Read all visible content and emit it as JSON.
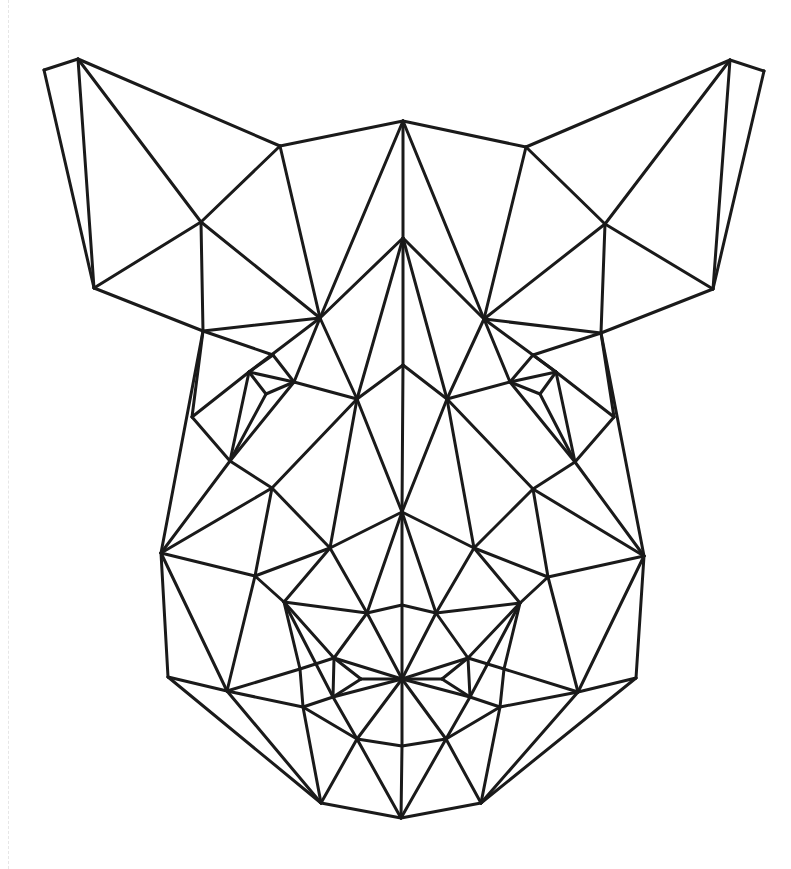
{
  "artwork": {
    "subject": "geometric low-poly boar head line drawing",
    "stroke_color": "#1a1a1a",
    "background_color": "#ffffff",
    "vertices": {
      "lE1": [
        44,
        70
      ],
      "lE2": [
        78,
        59
      ],
      "lE3": [
        280,
        146
      ],
      "lE4": [
        201,
        222
      ],
      "lE5": [
        94,
        288
      ],
      "rE1": [
        764,
        71
      ],
      "rE2": [
        730,
        60
      ],
      "rE3": [
        526,
        147
      ],
      "rE4": [
        605,
        224
      ],
      "rE5": [
        713,
        289
      ],
      "T": [
        403,
        121
      ],
      "M": [
        403,
        238
      ],
      "LN": [
        320,
        318
      ],
      "RN": [
        484,
        319
      ],
      "L1": [
        203,
        331
      ],
      "R1": [
        601,
        333
      ],
      "C1": [
        403,
        365
      ],
      "Le1": [
        273,
        355
      ],
      "Le2": [
        249,
        372
      ],
      "Le3": [
        294,
        382
      ],
      "Le4": [
        266,
        394
      ],
      "Re1": [
        533,
        355
      ],
      "Re2": [
        556,
        372
      ],
      "Re3": [
        510,
        382
      ],
      "Re4": [
        540,
        394
      ],
      "L2": [
        357,
        399
      ],
      "R2": [
        447,
        399
      ],
      "L3": [
        192,
        417
      ],
      "R3": [
        614,
        417
      ],
      "L4": [
        230,
        461
      ],
      "R4": [
        575,
        462
      ],
      "L5": [
        272,
        488
      ],
      "R5": [
        533,
        489
      ],
      "C2": [
        402,
        512
      ],
      "L6": [
        330,
        548
      ],
      "R6": [
        474,
        548
      ],
      "L7": [
        161,
        553
      ],
      "R7": [
        644,
        556
      ],
      "L8": [
        255,
        576
      ],
      "R8": [
        548,
        577
      ],
      "L9": [
        284,
        602
      ],
      "R9": [
        520,
        603
      ],
      "N1": [
        367,
        613
      ],
      "N2": [
        402,
        605
      ],
      "N3": [
        436,
        613
      ],
      "L10": [
        334,
        658
      ],
      "R10": [
        468,
        658
      ],
      "L11": [
        300,
        669
      ],
      "R11": [
        504,
        669
      ],
      "L12": [
        361,
        679
      ],
      "C3": [
        402,
        679
      ],
      "R12": [
        442,
        679
      ],
      "L13": [
        168,
        677
      ],
      "R13": [
        636,
        678
      ],
      "L14": [
        227,
        691
      ],
      "R14": [
        578,
        692
      ],
      "L15": [
        333,
        697
      ],
      "R15": [
        470,
        697
      ],
      "L16": [
        303,
        707
      ],
      "R16": [
        500,
        707
      ],
      "L17": [
        357,
        739
      ],
      "C4": [
        402,
        746
      ],
      "R17": [
        446,
        739
      ],
      "L18": [
        321,
        803
      ],
      "C5": [
        401,
        818
      ],
      "R18": [
        481,
        803
      ]
    },
    "edges": [
      [
        "lE1",
        "lE2"
      ],
      [
        "lE1",
        "lE5"
      ],
      [
        "lE2",
        "lE5"
      ],
      [
        "lE2",
        "lE4"
      ],
      [
        "lE2",
        "lE3"
      ],
      [
        "lE3",
        "lE4"
      ],
      [
        "lE4",
        "lE5"
      ],
      [
        "lE4",
        "LN"
      ],
      [
        "lE4",
        "L1"
      ],
      [
        "lE5",
        "L1"
      ],
      [
        "lE3",
        "LN"
      ],
      [
        "lE3",
        "T"
      ],
      [
        "rE1",
        "rE2"
      ],
      [
        "rE1",
        "rE5"
      ],
      [
        "rE2",
        "rE5"
      ],
      [
        "rE2",
        "rE4"
      ],
      [
        "rE2",
        "rE3"
      ],
      [
        "rE3",
        "rE4"
      ],
      [
        "rE4",
        "rE5"
      ],
      [
        "rE4",
        "RN"
      ],
      [
        "rE4",
        "R1"
      ],
      [
        "rE5",
        "R1"
      ],
      [
        "rE3",
        "RN"
      ],
      [
        "rE3",
        "T"
      ],
      [
        "T",
        "M"
      ],
      [
        "T",
        "LN"
      ],
      [
        "T",
        "RN"
      ],
      [
        "M",
        "LN"
      ],
      [
        "M",
        "RN"
      ],
      [
        "M",
        "C1"
      ],
      [
        "M",
        "L2"
      ],
      [
        "M",
        "R2"
      ],
      [
        "C1",
        "L2"
      ],
      [
        "C1",
        "R2"
      ],
      [
        "C1",
        "C2"
      ],
      [
        "L1",
        "LN"
      ],
      [
        "L1",
        "Le1"
      ],
      [
        "L1",
        "L3"
      ],
      [
        "L1",
        "L7"
      ],
      [
        "R1",
        "RN"
      ],
      [
        "R1",
        "Re1"
      ],
      [
        "R1",
        "R3"
      ],
      [
        "R1",
        "R7"
      ],
      [
        "LN",
        "Le3"
      ],
      [
        "LN",
        "L2"
      ],
      [
        "LN",
        "Le2"
      ],
      [
        "RN",
        "Re3"
      ],
      [
        "RN",
        "R2"
      ],
      [
        "RN",
        "Re2"
      ],
      [
        "Le1",
        "Le3"
      ],
      [
        "Le1",
        "Le2"
      ],
      [
        "Le2",
        "L3"
      ],
      [
        "Le2",
        "Le3"
      ],
      [
        "Le2",
        "L4"
      ],
      [
        "Le3",
        "Le4"
      ],
      [
        "Le4",
        "Le2"
      ],
      [
        "Le4",
        "L4"
      ],
      [
        "Le3",
        "L4"
      ],
      [
        "Le3",
        "L2"
      ],
      [
        "Re1",
        "Re3"
      ],
      [
        "Re1",
        "Re2"
      ],
      [
        "Re2",
        "R3"
      ],
      [
        "Re2",
        "Re3"
      ],
      [
        "Re2",
        "R4"
      ],
      [
        "Re3",
        "Re4"
      ],
      [
        "Re4",
        "Re2"
      ],
      [
        "Re4",
        "R4"
      ],
      [
        "Re3",
        "R4"
      ],
      [
        "Re3",
        "R2"
      ],
      [
        "L2",
        "L5"
      ],
      [
        "L2",
        "C2"
      ],
      [
        "L2",
        "L6"
      ],
      [
        "R2",
        "R5"
      ],
      [
        "R2",
        "C2"
      ],
      [
        "R2",
        "R6"
      ],
      [
        "L3",
        "L4"
      ],
      [
        "L4",
        "L5"
      ],
      [
        "L4",
        "L7"
      ],
      [
        "L5",
        "L7"
      ],
      [
        "L5",
        "L6"
      ],
      [
        "L5",
        "L8"
      ],
      [
        "R3",
        "R4"
      ],
      [
        "R4",
        "R5"
      ],
      [
        "R4",
        "R7"
      ],
      [
        "R5",
        "R7"
      ],
      [
        "R5",
        "R6"
      ],
      [
        "R5",
        "R8"
      ],
      [
        "C2",
        "L6"
      ],
      [
        "C2",
        "R6"
      ],
      [
        "C2",
        "N1"
      ],
      [
        "C2",
        "N3"
      ],
      [
        "C2",
        "N2"
      ],
      [
        "L6",
        "L8"
      ],
      [
        "L6",
        "L9"
      ],
      [
        "L6",
        "N1"
      ],
      [
        "R6",
        "R8"
      ],
      [
        "R6",
        "R9"
      ],
      [
        "R6",
        "N3"
      ],
      [
        "L7",
        "L8"
      ],
      [
        "L7",
        "L13"
      ],
      [
        "L7",
        "L14"
      ],
      [
        "R7",
        "R8"
      ],
      [
        "R7",
        "R13"
      ],
      [
        "R7",
        "R14"
      ],
      [
        "L8",
        "L9"
      ],
      [
        "L8",
        "L14"
      ],
      [
        "R8",
        "R9"
      ],
      [
        "R8",
        "R14"
      ],
      [
        "L9",
        "N1"
      ],
      [
        "L9",
        "L10"
      ],
      [
        "L9",
        "L11"
      ],
      [
        "L9",
        "L15"
      ],
      [
        "R9",
        "N3"
      ],
      [
        "R9",
        "R10"
      ],
      [
        "R9",
        "R11"
      ],
      [
        "R9",
        "R15"
      ],
      [
        "N1",
        "N2"
      ],
      [
        "N2",
        "N3"
      ],
      [
        "N2",
        "C3"
      ],
      [
        "N1",
        "C3"
      ],
      [
        "N3",
        "C3"
      ],
      [
        "N1",
        "L10"
      ],
      [
        "N3",
        "R10"
      ],
      [
        "L10",
        "L11"
      ],
      [
        "L10",
        "L12"
      ],
      [
        "L10",
        "C3"
      ],
      [
        "L10",
        "L15"
      ],
      [
        "R10",
        "R11"
      ],
      [
        "R10",
        "R12"
      ],
      [
        "R10",
        "C3"
      ],
      [
        "R10",
        "R15"
      ],
      [
        "L12",
        "C3"
      ],
      [
        "L12",
        "L15"
      ],
      [
        "R12",
        "C3"
      ],
      [
        "R12",
        "R15"
      ],
      [
        "L11",
        "L16"
      ],
      [
        "L11",
        "L14"
      ],
      [
        "L15",
        "L16"
      ],
      [
        "L15",
        "C3"
      ],
      [
        "L15",
        "L17"
      ],
      [
        "R11",
        "R16"
      ],
      [
        "R11",
        "R14"
      ],
      [
        "R15",
        "R16"
      ],
      [
        "R15",
        "C3"
      ],
      [
        "R15",
        "R17"
      ],
      [
        "L13",
        "L14"
      ],
      [
        "L13",
        "L18"
      ],
      [
        "L14",
        "L16"
      ],
      [
        "L14",
        "L18"
      ],
      [
        "R13",
        "R14"
      ],
      [
        "R13",
        "R18"
      ],
      [
        "R14",
        "R16"
      ],
      [
        "R14",
        "R18"
      ],
      [
        "L16",
        "L17"
      ],
      [
        "L16",
        "L18"
      ],
      [
        "R16",
        "R17"
      ],
      [
        "R16",
        "R18"
      ],
      [
        "C3",
        "L17"
      ],
      [
        "C3",
        "R17"
      ],
      [
        "C3",
        "C4"
      ],
      [
        "L17",
        "C4"
      ],
      [
        "R17",
        "C4"
      ],
      [
        "L17",
        "L18"
      ],
      [
        "R17",
        "R18"
      ],
      [
        "L17",
        "C5"
      ],
      [
        "R17",
        "C5"
      ],
      [
        "C4",
        "C5"
      ],
      [
        "L18",
        "C5"
      ],
      [
        "R18",
        "C5"
      ]
    ]
  }
}
